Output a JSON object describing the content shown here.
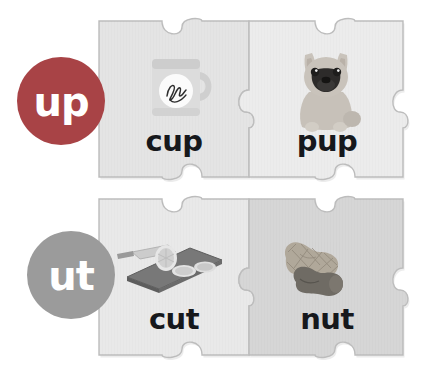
{
  "canvas": {
    "width": 447,
    "height": 385,
    "background": "#ffffff"
  },
  "colors": {
    "badge_up": "#a84346",
    "badge_ut": "#9b9b9b",
    "piece_light": "#e8e8e8",
    "piece_mid": "#dddddd",
    "piece_dark": "#d0d0d0",
    "piece_outline": "#b9b9b9",
    "word_color": "#16181c",
    "badge_label_color": "#ffffff"
  },
  "rows": [
    {
      "id": "row-up",
      "badge": {
        "label": "up",
        "color": "#a84346",
        "cx": 61,
        "cy": 101,
        "r": 44
      },
      "pieces": [
        {
          "id": "piece-cup",
          "word": "cup",
          "image": "mug-icon",
          "shade": "#e4e4e4"
        },
        {
          "id": "piece-pup",
          "word": "pup",
          "image": "puppy-icon",
          "shade": "#ececec"
        }
      ]
    },
    {
      "id": "row-ut",
      "badge": {
        "label": "ut",
        "color": "#9b9b9b",
        "cx": 71,
        "cy": 275,
        "r": 44
      },
      "pieces": [
        {
          "id": "piece-cut",
          "word": "cut",
          "image": "cutting-board-icon",
          "shade": "#e9e9e9"
        },
        {
          "id": "piece-nut",
          "word": "nut",
          "image": "peanut-icon",
          "shade": "#d6d6d6"
        }
      ]
    }
  ],
  "words": {
    "cup": "cup",
    "pup": "pup",
    "cut": "cut",
    "nut": "nut"
  },
  "badges": {
    "up": "up",
    "ut": "ut"
  }
}
